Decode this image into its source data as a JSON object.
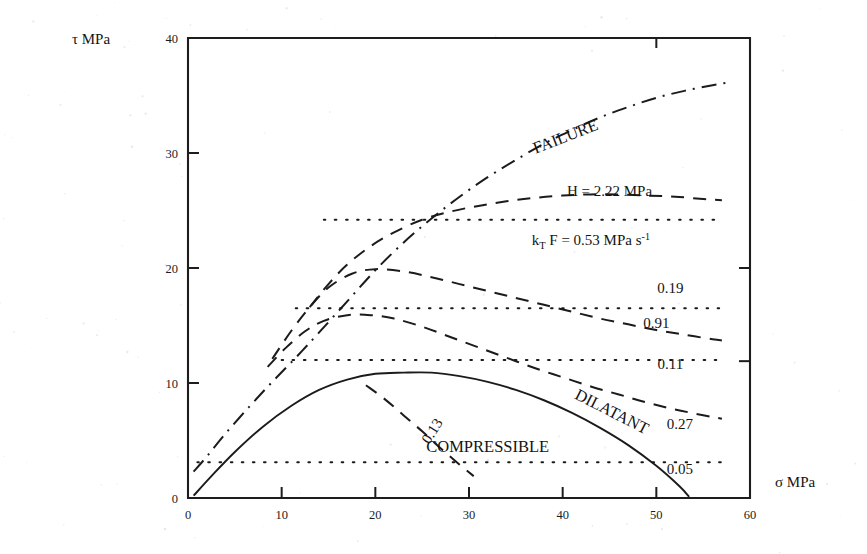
{
  "figure": {
    "yaxis_label": "τ  MPa",
    "xaxis_label": "σ  MPa"
  },
  "chart_data": {
    "type": "line",
    "title": "",
    "xlabel": "σ MPa",
    "ylabel": "τ MPa",
    "xlim": [
      0,
      60
    ],
    "ylim": [
      0,
      40
    ],
    "xticks": [
      "0",
      "10",
      "20",
      "30",
      "40",
      "50",
      "60"
    ],
    "yticks": [
      "0",
      "10",
      "20",
      "30",
      "40"
    ],
    "grid": false,
    "legend_position": "inline-annotations",
    "annotations": [
      {
        "id": "failure",
        "text": "FAILURE",
        "x": 40.5,
        "y": 31.0,
        "rotation": -21
      },
      {
        "id": "h-value",
        "text": "H = 2.22  MPa",
        "x": 45.0,
        "y": 26.3,
        "rotation": 0
      },
      {
        "id": "ktf-value",
        "text": "k_T F = 0.53  MPa s^-1",
        "x": 43.0,
        "y": 22.0,
        "rotation": 0
      },
      {
        "id": "label-019",
        "text": "0.19",
        "x": 51.5,
        "y": 17.8,
        "rotation": 0
      },
      {
        "id": "label-091",
        "text": "0.91",
        "x": 50.0,
        "y": 14.8,
        "rotation": 0
      },
      {
        "id": "label-011",
        "text": "0.11",
        "x": 51.5,
        "y": 11.2,
        "rotation": 0
      },
      {
        "id": "label-027",
        "text": "0.27",
        "x": 52.5,
        "y": 6.0,
        "rotation": 0
      },
      {
        "id": "label-005",
        "text": "0.05",
        "x": 52.5,
        "y": 2.1,
        "rotation": 0
      },
      {
        "id": "label-013",
        "text": "0.13",
        "x": 26.5,
        "y": 5.6,
        "rotation": -58
      },
      {
        "id": "compressible",
        "text": "COMPRESSIBLE",
        "x": 32.0,
        "y": 4.0,
        "rotation": 0
      },
      {
        "id": "dilatant",
        "text": "DILATANT",
        "x": 45.0,
        "y": 7.1,
        "rotation": 27
      }
    ],
    "series": [
      {
        "name": "FAILURE",
        "style": "dashdot",
        "label": "FAILURE",
        "x": [
          0.6,
          2.0,
          4.0,
          6.5,
          9.0,
          11.5,
          14.0,
          17.0,
          20.0,
          23.0,
          26.0,
          29.0,
          32.0,
          35.0,
          38.0,
          41.0,
          44.0,
          47.0,
          50.0,
          53.0,
          56.0,
          57.5
        ],
        "y": [
          2.3,
          3.6,
          5.6,
          7.9,
          10.1,
          12.2,
          14.4,
          17.1,
          19.8,
          22.2,
          24.3,
          26.2,
          27.9,
          29.4,
          30.8,
          32.0,
          33.1,
          34.0,
          34.8,
          35.4,
          35.9,
          36.1
        ]
      },
      {
        "name": "H = 2.22 MPa",
        "style": "dashed",
        "label": "H = 2.22  MPa",
        "x": [
          13.0,
          15.0,
          17.0,
          19.5,
          22.0,
          25.0,
          28.0,
          31.0,
          34.0,
          37.0,
          40.0,
          43.0,
          46.0,
          49.0,
          52.0,
          55.0,
          57.0
        ],
        "y": [
          16.6,
          18.6,
          20.3,
          21.9,
          23.1,
          24.2,
          24.9,
          25.4,
          25.8,
          26.1,
          26.3,
          26.4,
          26.4,
          26.3,
          26.2,
          26.0,
          25.9
        ]
      },
      {
        "name": "k_T F = 0.53 MPa s^-1",
        "style": "dotted",
        "label": "k_T F = 0.53  MPa s^-1",
        "x": [
          14.5,
          18,
          22,
          26,
          30,
          34,
          38,
          42,
          46,
          50,
          54,
          57
        ],
        "y": [
          24.2,
          24.2,
          24.2,
          24.2,
          24.2,
          24.2,
          24.2,
          24.2,
          24.2,
          24.2,
          24.2,
          24.2
        ]
      },
      {
        "name": "0.91",
        "style": "dashed",
        "label": "0.91",
        "x": [
          9.0,
          11.0,
          13.0,
          15.0,
          17.5,
          20.0,
          23.0,
          26.0,
          29.0,
          32.0,
          35.0,
          38.0,
          41.0,
          44.0,
          47.0,
          50.0,
          53.0,
          56.0,
          57.0
        ],
        "y": [
          12.1,
          14.5,
          16.6,
          18.3,
          19.5,
          19.9,
          19.7,
          19.2,
          18.6,
          18.0,
          17.4,
          16.8,
          16.2,
          15.6,
          15.1,
          14.6,
          14.2,
          13.8,
          13.7
        ]
      },
      {
        "name": "0.19",
        "style": "dotted",
        "label": "0.19",
        "x": [
          11.5,
          15,
          19,
          23,
          27,
          31,
          35,
          39,
          43,
          47,
          51,
          55,
          57
        ],
        "y": [
          16.5,
          16.5,
          16.5,
          16.5,
          16.5,
          16.5,
          16.5,
          16.5,
          16.5,
          16.5,
          16.5,
          16.5,
          16.5
        ]
      },
      {
        "name": "0.27",
        "style": "dashed",
        "label": "0.27",
        "x": [
          8.5,
          10.5,
          12.5,
          14.5,
          17.0,
          19.5,
          22.0,
          25.0,
          28.0,
          31.0,
          34.0,
          37.0,
          40.0,
          43.0,
          46.0,
          49.0,
          52.0,
          55.0,
          57.0
        ],
        "y": [
          11.4,
          13.1,
          14.5,
          15.4,
          15.9,
          15.9,
          15.6,
          14.9,
          14.0,
          13.1,
          12.2,
          11.3,
          10.5,
          9.7,
          9.0,
          8.3,
          7.7,
          7.2,
          6.9
        ]
      },
      {
        "name": "0.11",
        "style": "dotted",
        "label": "0.11",
        "x": [
          10.0,
          14,
          18,
          22,
          26,
          30,
          34,
          38,
          42,
          46,
          50,
          54,
          57
        ],
        "y": [
          12.0,
          12.0,
          12.0,
          12.0,
          12.0,
          12.0,
          12.0,
          12.0,
          12.0,
          12.0,
          12.0,
          12.0,
          12.0
        ]
      },
      {
        "name": "0.13",
        "style": "dashed",
        "label": "0.13",
        "x": [
          19.0,
          21.0,
          23.0,
          25.0,
          27.0,
          29.0,
          30.5
        ],
        "y": [
          9.8,
          8.6,
          7.2,
          5.8,
          4.3,
          2.9,
          1.9
        ]
      },
      {
        "name": "COMPRESSIBLE / DILATANT boundary",
        "style": "solid",
        "label": "COMPRESSIBLE",
        "x": [
          0.6,
          2.5,
          5.0,
          8.0,
          11.0,
          14.0,
          17.0,
          20.0,
          23.0,
          26.0,
          29.0,
          32.0,
          35.0,
          38.0,
          41.0,
          44.0,
          47.0,
          50.0,
          52.5,
          53.5
        ],
        "y": [
          0.2,
          1.9,
          4.0,
          6.2,
          8.0,
          9.4,
          10.3,
          10.8,
          10.9,
          10.9,
          10.6,
          10.1,
          9.4,
          8.5,
          7.4,
          6.1,
          4.6,
          2.8,
          1.0,
          0.1
        ]
      },
      {
        "name": "0.05",
        "style": "dotted",
        "label": "0.05",
        "x": [
          1.0,
          5,
          9,
          13,
          17,
          21,
          25,
          29,
          33,
          37,
          41,
          45,
          49,
          53,
          57
        ],
        "y": [
          3.1,
          3.1,
          3.1,
          3.1,
          3.1,
          3.1,
          3.1,
          3.1,
          3.1,
          3.1,
          3.1,
          3.1,
          3.1,
          3.1,
          3.1
        ]
      }
    ]
  }
}
